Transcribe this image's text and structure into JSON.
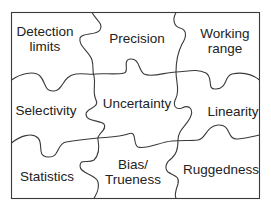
{
  "diagram": {
    "type": "jigsaw-puzzle",
    "colors": {
      "line": "#3a3a3a",
      "text": "#222222",
      "background": "#ffffff"
    },
    "pieces": [
      {
        "id": "detection-limits",
        "lines": [
          "Detection",
          "limits"
        ],
        "x": 45,
        "y": 39
      },
      {
        "id": "precision",
        "lines": [
          "Precision"
        ],
        "x": 137,
        "y": 38
      },
      {
        "id": "working-range",
        "lines": [
          "Working",
          "range"
        ],
        "x": 225,
        "y": 41
      },
      {
        "id": "selectivity",
        "lines": [
          "Selectivity"
        ],
        "x": 46,
        "y": 110
      },
      {
        "id": "uncertainty",
        "lines": [
          "Uncertainty"
        ],
        "x": 137,
        "y": 103
      },
      {
        "id": "linearity",
        "lines": [
          "Linearity"
        ],
        "x": 233,
        "y": 111
      },
      {
        "id": "statistics",
        "lines": [
          "Statistics"
        ],
        "x": 47,
        "y": 176
      },
      {
        "id": "bias-trueness",
        "lines": [
          "Bias/",
          "Trueness"
        ],
        "x": 133,
        "y": 172
      },
      {
        "id": "ruggedness",
        "lines": [
          "Ruggedness"
        ],
        "x": 221,
        "y": 169
      }
    ]
  }
}
